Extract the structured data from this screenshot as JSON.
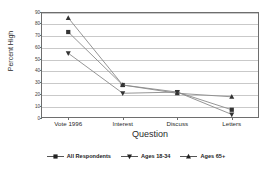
{
  "chart_data": {
    "type": "line",
    "title": "",
    "xlabel": "Question",
    "ylabel": "Percent High",
    "categories": [
      "Vote 1996",
      "Interest",
      "Discuss",
      "Letters"
    ],
    "ylim": [
      0,
      90
    ],
    "yticks": [
      0,
      10,
      20,
      30,
      40,
      50,
      60,
      70,
      80,
      90
    ],
    "ytick_labels": [
      "0",
      "10",
      "20",
      "30",
      "40",
      "50",
      "60",
      "70",
      "80",
      "90"
    ],
    "grid": true,
    "legend_position": "bottom",
    "series": [
      {
        "name": "All Respondents",
        "marker": "square",
        "color": "#333333",
        "values": [
          73,
          28,
          22,
          7
        ]
      },
      {
        "name": "Ages 18-34",
        "marker": "triangle-down",
        "color": "#333333",
        "values": [
          55,
          21,
          22,
          3
        ]
      },
      {
        "name": "Ages 65+",
        "marker": "triangle-up",
        "color": "#333333",
        "values": [
          85,
          28,
          21,
          18
        ]
      }
    ]
  },
  "axes": {
    "y_title": "Percent High",
    "x_title": "Question"
  },
  "legend": {
    "items": [
      {
        "label": "All Respondents",
        "marker": "square-marker-icon"
      },
      {
        "label": "Ages 18-34",
        "marker": "triangle-down-marker-icon"
      },
      {
        "label": "Ages 65+",
        "marker": "triangle-up-marker-icon"
      }
    ]
  }
}
